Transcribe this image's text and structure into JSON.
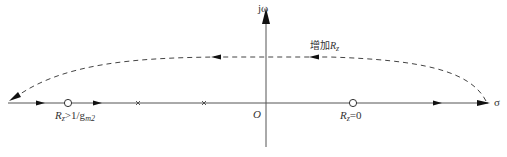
{
  "diagram": {
    "type": "root-locus",
    "axes": {
      "imag_label": "jω",
      "real_label": "σ",
      "origin_label": "O"
    },
    "annotation": {
      "prefix": "增加",
      "var": "R",
      "sub": "z"
    },
    "zero_left_label": {
      "var": "R",
      "sub": "z",
      "rest": ">1/g",
      "sub2": "m2"
    },
    "zero_right_label": {
      "var": "R",
      "sub": "z",
      "rest": "=0"
    },
    "elements": {
      "zeros": [
        {
          "x": 68,
          "y": 103
        },
        {
          "x": 353,
          "y": 103
        }
      ],
      "poles": [
        {
          "x": 138,
          "y": 103
        },
        {
          "x": 204,
          "y": 103
        }
      ],
      "colors": {
        "line": "#444444",
        "dashed": "#444444"
      }
    }
  }
}
